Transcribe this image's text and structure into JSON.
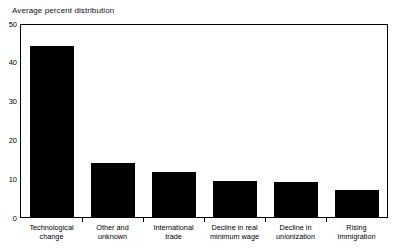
{
  "chart_data": {
    "type": "bar",
    "title": "Average percent distribution",
    "xlabel": "",
    "ylabel": "",
    "ylim": [
      0,
      50
    ],
    "yticks": [
      "0",
      "10",
      "20",
      "30",
      "40",
      "50"
    ],
    "grid": false,
    "legend": null,
    "categories": [
      "Technological change",
      "Other and unknown",
      "International trade",
      "Decline in real minimum wage",
      "Decline in unionization",
      "Rising Immigration"
    ],
    "category_lines": [
      [
        "Technological",
        "change"
      ],
      [
        "Other and",
        "unknown"
      ],
      [
        "International",
        "trade"
      ],
      [
        "Decline in real",
        "minimum wage"
      ],
      [
        "Decline in",
        "unionization"
      ],
      [
        "Rising",
        "Immigration"
      ]
    ],
    "values": [
      44.3,
      14.3,
      11.8,
      9.5,
      9.3,
      7.3
    ],
    "bar_color": "#000000",
    "axis_color": "#000000",
    "background_color": "#ffffff"
  }
}
